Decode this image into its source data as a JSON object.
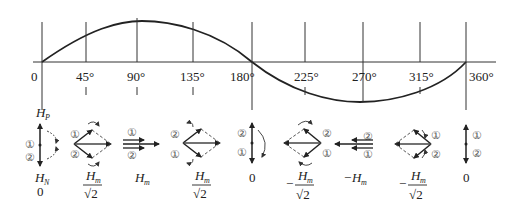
{
  "diagram": {
    "title": "",
    "axis": {
      "tick_labels": [
        "0",
        "45°",
        "90°",
        "135°",
        "180°",
        "225°",
        "270°",
        "315°",
        "360°"
      ]
    },
    "top_label": "H",
    "top_label_sub": "P",
    "markers": {
      "one": "①",
      "two": "②"
    },
    "states": [
      {
        "angle": "0",
        "main": "H",
        "sub": "N",
        "value": "0"
      },
      {
        "angle": "45°",
        "numerator": "H",
        "num_sub": "m",
        "denominator": "√2",
        "sign": ""
      },
      {
        "angle": "90°",
        "label": "H",
        "sub": "m",
        "sign": ""
      },
      {
        "angle": "135°",
        "numerator": "H",
        "num_sub": "m",
        "denominator": "√2",
        "sign": ""
      },
      {
        "angle": "180°",
        "value": "0"
      },
      {
        "angle": "225°",
        "numerator": "H",
        "num_sub": "m",
        "denominator": "√2",
        "sign": "−"
      },
      {
        "angle": "270°",
        "label": "H",
        "sub": "m",
        "sign": "−"
      },
      {
        "angle": "315°",
        "numerator": "H",
        "num_sub": "m",
        "denominator": "√2",
        "sign": "−"
      },
      {
        "angle": "360°",
        "value": "0"
      }
    ]
  }
}
